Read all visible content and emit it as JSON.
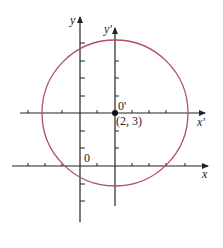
{
  "diagram": {
    "title": "",
    "axes": {
      "x_label": "x",
      "y_label": "y",
      "x_prime_label": "x'",
      "y_prime_label": "y'"
    },
    "origin_label": "0",
    "new_origin_label": "0'",
    "new_origin_coords": "(2, 3)",
    "circle": {
      "center": [
        2,
        3
      ],
      "radius_units": 4.2,
      "stroke_color": "#b0505a"
    },
    "axis_color": "#222222"
  }
}
